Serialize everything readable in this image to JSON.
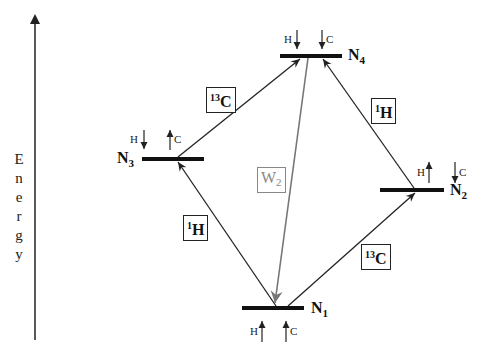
{
  "axis": {
    "label": "Energy",
    "letters": [
      "E",
      "n",
      "e",
      "r",
      "g",
      "y"
    ]
  },
  "levels": [
    {
      "id": "N4",
      "base": "N",
      "index": "4",
      "spin_H": "H",
      "spin_H_dir": "down",
      "spin_C": "C",
      "spin_C_dir": "down"
    },
    {
      "id": "N3",
      "base": "N",
      "index": "3",
      "spin_H": "H",
      "spin_H_dir": "down",
      "spin_C": "C",
      "spin_C_dir": "up"
    },
    {
      "id": "N2",
      "base": "N",
      "index": "2",
      "spin_H": "H",
      "spin_H_dir": "up",
      "spin_C": "C",
      "spin_C_dir": "down"
    },
    {
      "id": "N1",
      "base": "N",
      "index": "1",
      "spin_H": "H",
      "spin_H_dir": "up",
      "spin_C": "C",
      "spin_C_dir": "up"
    }
  ],
  "transitions": [
    {
      "from": "N1",
      "to": "N3",
      "label_sup": "1",
      "label_main": "H",
      "color": "#222222"
    },
    {
      "from": "N3",
      "to": "N4",
      "label_sup": "13",
      "label_main": "C",
      "color": "#222222"
    },
    {
      "from": "N1",
      "to": "N2",
      "label_sup": "13",
      "label_main": "C",
      "color": "#222222"
    },
    {
      "from": "N2",
      "to": "N4",
      "label_sup": "1",
      "label_main": "H",
      "color": "#222222"
    },
    {
      "from": "N4",
      "to": "N1",
      "label_main": "W",
      "label_sub": "2",
      "color": "#888888"
    }
  ]
}
